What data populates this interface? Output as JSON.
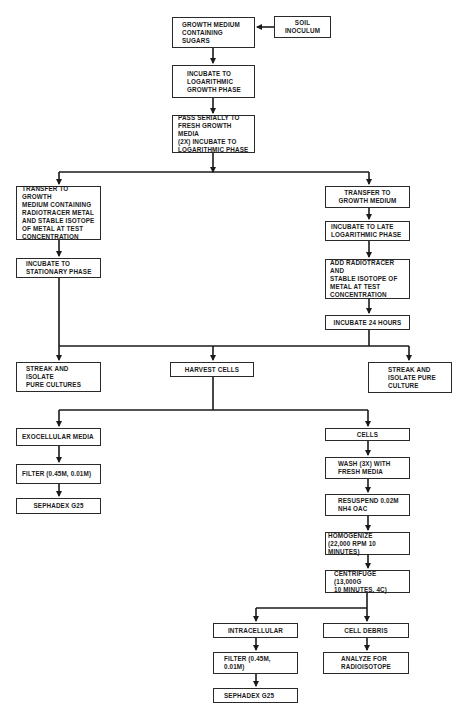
{
  "diagram": {
    "type": "flowchart",
    "line_color": "#1a1a1a",
    "nodes": {
      "growth_medium": "GROWTH MEDIUM\nCONTAINING\nSUGARS",
      "soil_inoculum": "SOIL INOCULUM",
      "incubate_log": "INCUBATE TO\nLOGARITHMIC\nGROWTH PHASE",
      "pass_serially": "PASS SERIALLY TO\nFRESH GROWTH MEDIA\n(2x) INCUBATE TO\nLOGARITHMIC PHASE",
      "transfer_radiotracer": "TRANSFER TO GROWTH\nMEDIUM CONTAINING\nRADIOTRACER METAL\nAND STABLE ISOTOPE\nOF METAL AT TEST\nCONCENTRATION",
      "incubate_stationary": "INCUBATE TO\nSTATIONARY PHASE",
      "transfer_growth": "TRANSFER TO\nGROWTH MEDIUM",
      "incubate_late_log": "INCUBATE TO LATE\nLOGARITHMIC PHASE",
      "add_radiotracer": "ADD RADIOTRACER AND\nSTABLE ISOTOPE OF\nMETAL AT TEST\nCONCENTRATION",
      "incubate_24": "INCUBATE 24 HOURS",
      "streak_left": "STREAK AND ISOLATE\nPURE CULTURES",
      "harvest_cells": "HARVEST CELLS",
      "streak_right": "STREAK AND\nISOLATE PURE\nCULTURE",
      "exocellular": "EXOCELLULAR MEDIA",
      "filter_left": "FILTER (0.45µ, 0.01µ)",
      "sephadex_left": "SEPHADEX G25",
      "cells": "CELLS",
      "wash": "WASH (3x) WITH\nFRESH MEDIA",
      "resuspend": "RESUSPEND 0.02M\nNH4 OAc",
      "homogenize": "HOMOGENIZE\n(22,000 RPM 10 MINUTES)",
      "centrifuge": "CENTRIFUGE (13,000g\n10 MINUTES, 4C)",
      "intracellular": "INTRACELLULAR",
      "cell_debris": "CELL DEBRIS",
      "filter_bottom": "FILTER (0.45µ,\n0.01µ)",
      "analyze": "ANALYZE FOR\nRADIOISOTOPE",
      "sephadex_bottom": "SEPHADEX G25"
    },
    "edges": [
      [
        "soil_inoculum",
        "growth_medium"
      ],
      [
        "growth_medium",
        "incubate_log"
      ],
      [
        "incubate_log",
        "pass_serially"
      ],
      [
        "pass_serially",
        "transfer_radiotracer"
      ],
      [
        "pass_serially",
        "transfer_growth"
      ],
      [
        "transfer_radiotracer",
        "incubate_stationary"
      ],
      [
        "transfer_growth",
        "incubate_late_log"
      ],
      [
        "incubate_late_log",
        "add_radiotracer"
      ],
      [
        "add_radiotracer",
        "incubate_24"
      ],
      [
        "incubate_stationary",
        "streak_left"
      ],
      [
        "incubate_stationary",
        "harvest_cells"
      ],
      [
        "incubate_24",
        "harvest_cells"
      ],
      [
        "incubate_24",
        "streak_right"
      ],
      [
        "harvest_cells",
        "exocellular"
      ],
      [
        "harvest_cells",
        "cells"
      ],
      [
        "exocellular",
        "filter_left"
      ],
      [
        "filter_left",
        "sephadex_left"
      ],
      [
        "cells",
        "wash"
      ],
      [
        "wash",
        "resuspend"
      ],
      [
        "resuspend",
        "homogenize"
      ],
      [
        "homogenize",
        "centrifuge"
      ],
      [
        "centrifuge",
        "intracellular"
      ],
      [
        "centrifuge",
        "cell_debris"
      ],
      [
        "intracellular",
        "filter_bottom"
      ],
      [
        "filter_bottom",
        "sephadex_bottom"
      ],
      [
        "cell_debris",
        "analyze"
      ]
    ]
  }
}
